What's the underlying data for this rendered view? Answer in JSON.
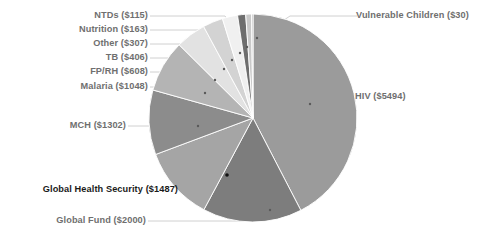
{
  "chart_data": {
    "type": "pie",
    "title": "",
    "subtitle": "",
    "xlabel": "",
    "ylabel": "",
    "legend_position": "none",
    "grid": false,
    "units": "US$ millions",
    "total": 13160,
    "categories": [
      "HIV",
      "Global Fund",
      "Global Health Security",
      "MCH",
      "Malaria",
      "FP/RH",
      "TB",
      "Other",
      "Nutrition",
      "NTDs",
      "Vulnerable Children"
    ],
    "values": [
      5494,
      2000,
      1487,
      1302,
      1048,
      608,
      406,
      307,
      163,
      115,
      30
    ],
    "labels": [
      "HIV ($5494)",
      "Global Fund ($2000)",
      "Global Health Security ($1487)",
      "MCH ($1302)",
      "Malaria ($1048)",
      "FP/RH ($608)",
      "TB ($406)",
      "Other ($307)",
      "Nutrition ($163)",
      "NTDs ($115)",
      "Vulnerable Children ($30)"
    ],
    "slice_colors": [
      "#9b9b9b",
      "#7d7d7d",
      "#a5a5a5",
      "#8c8c8c",
      "#b4b4b4",
      "#e2e2e2",
      "#d3d3d3",
      "#f0f0f0",
      "#6e6e6e",
      "#c9c9c9",
      "#b8b8b8"
    ],
    "highlight_category": "Global Health Security",
    "leader_line_color": "#c4c4c4",
    "label_color": "#8d8d8d",
    "highlight_label_color": "#1a1a1a",
    "background_color": "#ffffff"
  },
  "slices": [
    {
      "category": "HIV",
      "amount": "$5494",
      "label": "HIV ($5494)",
      "value": 5494
    },
    {
      "category": "Global Fund",
      "amount": "$2000",
      "label": "Global Fund ($2000)",
      "value": 2000
    },
    {
      "category": "Global Health Security",
      "amount": "$1487",
      "label": "Global Health Security ($1487)",
      "value": 1487
    },
    {
      "category": "MCH",
      "amount": "$1302",
      "label": "MCH ($1302)",
      "value": 1302
    },
    {
      "category": "Malaria",
      "amount": "$1048",
      "label": "Malaria ($1048)",
      "value": 1048
    },
    {
      "category": "FP/RH",
      "amount": "$608",
      "label": "FP/RH ($608)",
      "value": 608
    },
    {
      "category": "TB",
      "amount": "$406",
      "label": "TB ($406)",
      "value": 406
    },
    {
      "category": "Other",
      "amount": "$307",
      "label": "Other ($307)",
      "value": 307
    },
    {
      "category": "Nutrition",
      "amount": "$163",
      "label": "Nutrition ($163)",
      "value": 163
    },
    {
      "category": "NTDs",
      "amount": "$115",
      "label": "NTDs ($115)",
      "value": 115
    },
    {
      "category": "Vulnerable Children",
      "amount": "$30",
      "label": "Vulnerable Children ($30)",
      "value": 30
    }
  ]
}
